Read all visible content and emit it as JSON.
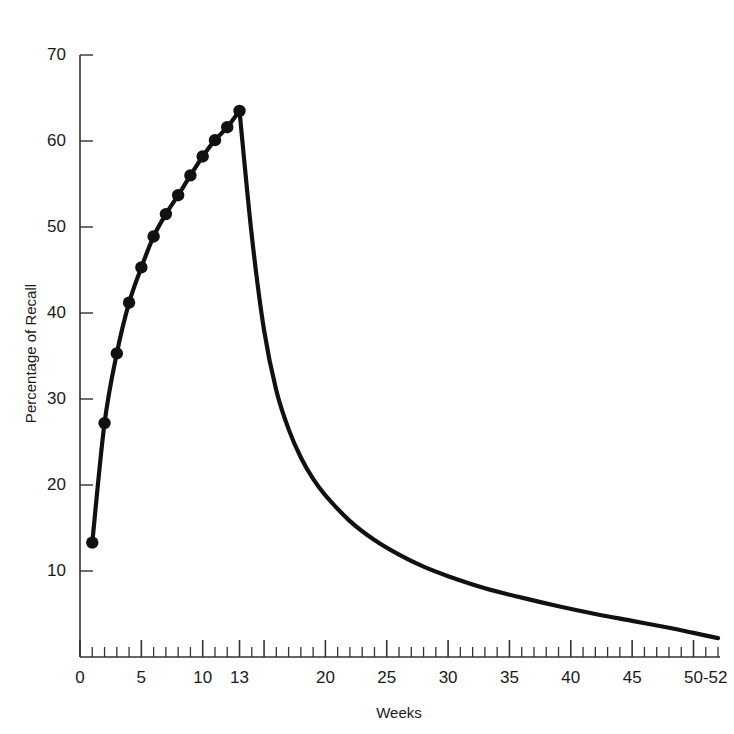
{
  "chart_data": {
    "type": "line",
    "title": "",
    "xlabel": "Weeks",
    "ylabel": "Percentage of Recall",
    "xlim": [
      0,
      52
    ],
    "ylim": [
      0,
      70
    ],
    "grid": false,
    "legend": "none",
    "x_tick_labels": [
      "0",
      "5",
      "10",
      "13",
      "20",
      "25",
      "30",
      "35",
      "40",
      "45",
      "50-52"
    ],
    "x_tick_values": [
      0,
      5,
      10,
      13,
      20,
      25,
      30,
      35,
      40,
      45,
      51
    ],
    "x_minor_tick_interval": 1,
    "y_tick_labels": [
      "10",
      "20",
      "30",
      "40",
      "50",
      "60",
      "70"
    ],
    "y_tick_values": [
      10,
      20,
      30,
      40,
      50,
      60,
      70
    ],
    "series": [
      {
        "name": "Acquisition",
        "markers": true,
        "x": [
          1,
          2,
          3,
          4,
          5,
          6,
          7,
          8,
          9,
          10,
          11,
          12,
          13
        ],
        "values": [
          13.3,
          27.2,
          35.3,
          41.2,
          45.3,
          48.9,
          51.5,
          53.7,
          56.0,
          58.2,
          60.1,
          61.6,
          63.5
        ]
      },
      {
        "name": "Retention decay",
        "markers": false,
        "x": [
          13,
          14,
          15,
          16,
          17,
          18,
          19,
          20,
          22,
          24,
          26,
          28,
          30,
          33,
          36,
          39,
          42,
          45,
          48,
          50,
          52
        ],
        "values": [
          63.5,
          49.0,
          38.0,
          31.0,
          26.5,
          23.2,
          20.7,
          18.8,
          15.8,
          13.6,
          11.9,
          10.5,
          9.4,
          8.0,
          6.9,
          5.9,
          5.0,
          4.2,
          3.4,
          2.8,
          2.2
        ]
      }
    ]
  },
  "axis_title_x": "Weeks",
  "axis_title_y": "Percentage of Recall",
  "colors": {
    "line": "#111111",
    "axis": "#333333",
    "background": "#ffffff"
  }
}
